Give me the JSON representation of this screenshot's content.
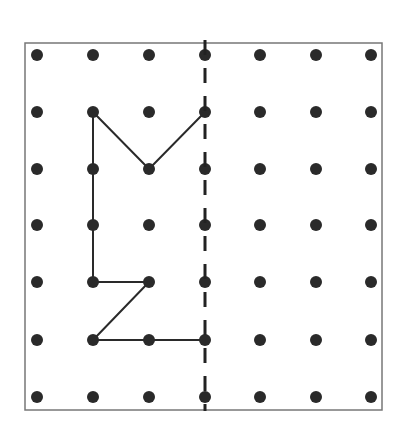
{
  "diagram": {
    "type": "geoboard-reflection",
    "grid": {
      "cols": 7,
      "rows": 7,
      "x_positions": [
        37,
        93,
        149,
        205,
        260,
        316,
        371
      ],
      "y_positions": [
        55,
        112,
        169,
        225,
        282,
        340,
        397
      ],
      "dot_radius": 6,
      "dot_color": "#2a2a2a"
    },
    "border": {
      "x": 25,
      "y": 43,
      "width": 357,
      "height": 367,
      "color": "#777777"
    },
    "mirror_line": {
      "style": "dashed",
      "col": 3,
      "x": 205,
      "y_start": 40,
      "y_end": 411,
      "color": "#222222"
    },
    "shape": {
      "color": "#2a2a2a",
      "segments": [
        {
          "from": [
            1,
            1
          ],
          "to": [
            1,
            4
          ]
        },
        {
          "from": [
            1,
            4
          ],
          "to": [
            2,
            4
          ]
        },
        {
          "from": [
            2,
            4
          ],
          "to": [
            1,
            5
          ]
        },
        {
          "from": [
            1,
            5
          ],
          "to": [
            3,
            5
          ]
        },
        {
          "from": [
            1,
            1
          ],
          "to": [
            2,
            2
          ]
        },
        {
          "from": [
            2,
            2
          ],
          "to": [
            3,
            1
          ]
        }
      ]
    }
  }
}
